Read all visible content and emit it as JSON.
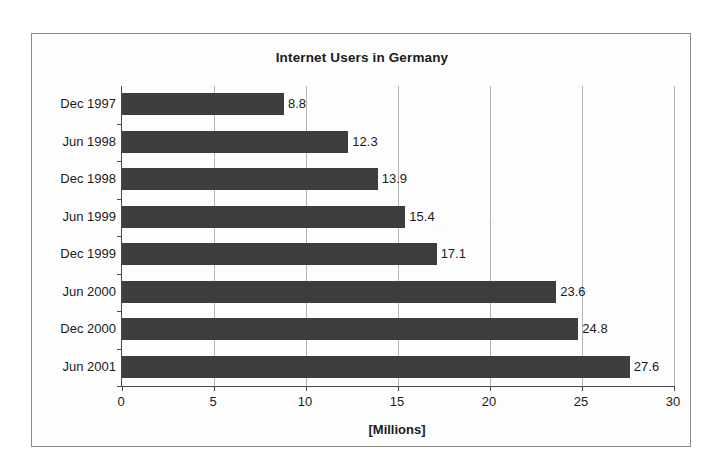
{
  "chart_data": {
    "type": "bar",
    "orientation": "horizontal",
    "title": "Internet Users in Germany",
    "xlabel": "[Millions]",
    "ylabel": "",
    "categories": [
      "Dec 1997",
      "Jun 1998",
      "Dec 1998",
      "Jun 1999",
      "Dec 1999",
      "Jun 2000",
      "Dec 2000",
      "Jun 2001"
    ],
    "values": [
      8.8,
      12.3,
      13.9,
      15.4,
      17.1,
      23.6,
      24.8,
      27.6
    ],
    "value_labels": [
      "8.8",
      "12.3",
      "13.9",
      "15.4",
      "17.1",
      "23.6",
      "24.8",
      "27.6"
    ],
    "xlim": [
      0,
      30
    ],
    "xticks": [
      0,
      5,
      10,
      15,
      20,
      25,
      30
    ],
    "xtick_labels": [
      "0",
      "5",
      "10",
      "15",
      "20",
      "25",
      "30"
    ],
    "grid": true,
    "grid_axis": "x",
    "legend": false,
    "bar_color": "#3d3d3d",
    "background_color": "#fdfdfd",
    "frame_color": "#8b8b8b",
    "axis_color": "#4a4a4a",
    "gridline_color": "#b4b4b4",
    "text_color": "#1b1b1b"
  }
}
